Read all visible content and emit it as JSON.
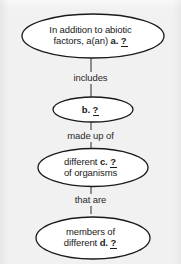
{
  "diagram": {
    "type": "flowchart",
    "orientation": "vertical",
    "background_color": "#f1f1f1",
    "node_fill_color": "#ffffff",
    "node_stroke_color": "#1a1a1a",
    "text_color": "#1a1a1a",
    "nodes": [
      {
        "id": "node-a",
        "shape": "ellipse",
        "lines": [
          {
            "text": "In addition to abiotic"
          },
          {
            "prefix": "factors, a(an) ",
            "blank_label": "a.",
            "blank_mark": "?"
          }
        ]
      },
      {
        "id": "node-b",
        "shape": "ellipse",
        "lines": [
          {
            "prefix": "",
            "blank_label": "b.",
            "blank_mark": "?"
          }
        ]
      },
      {
        "id": "node-c",
        "shape": "ellipse",
        "lines": [
          {
            "prefix": "different ",
            "blank_label": "c.",
            "blank_mark": "?"
          },
          {
            "text": "of organisms"
          }
        ]
      },
      {
        "id": "node-d",
        "shape": "ellipse",
        "lines": [
          {
            "text": "members of"
          },
          {
            "prefix": "different ",
            "blank_label": "d.",
            "blank_mark": "?"
          }
        ]
      }
    ],
    "edges": [
      {
        "id": "edge-1",
        "from": "node-a",
        "to": "node-b",
        "label": "includes"
      },
      {
        "id": "edge-2",
        "from": "node-b",
        "to": "node-c",
        "label": "made up of"
      },
      {
        "id": "edge-3",
        "from": "node-c",
        "to": "node-d",
        "label": "that are"
      }
    ]
  },
  "text": {
    "node_a_line1": "In addition to abiotic",
    "node_a_line2_prefix": "factors, a(an) ",
    "node_a_blank_label": "a.",
    "node_a_blank_mark": "?",
    "node_b_blank_label": "b.",
    "node_b_blank_mark": "?",
    "node_c_line1_prefix": "different ",
    "node_c_blank_label": "c.",
    "node_c_blank_mark": "?",
    "node_c_line2": "of organisms",
    "node_d_line1": "members of",
    "node_d_line2_prefix": "different ",
    "node_d_blank_label": "d.",
    "node_d_blank_mark": "?",
    "edge_1_label": "includes",
    "edge_2_label": "made up of",
    "edge_3_label": "that are"
  }
}
